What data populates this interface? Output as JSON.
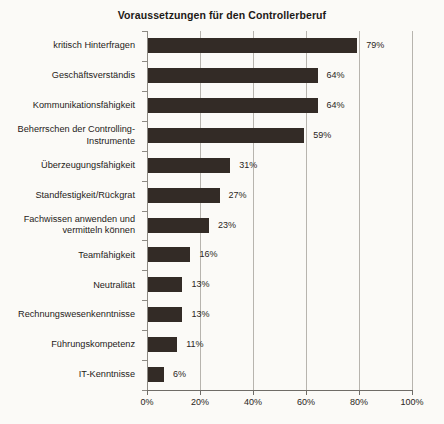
{
  "chart_data": {
    "type": "bar",
    "orientation": "horizontal",
    "title": "Voraussetzungen für den Controllerberuf",
    "xlabel": "",
    "ylabel": "",
    "xlim": [
      0,
      100
    ],
    "grid": true,
    "legend": "none",
    "bar_color": "#332b26",
    "categories": [
      "kritisch Hinterfragen",
      "Geschäftsverständis",
      "Kommunikationsfähigkeit",
      "Beherrschen der Controlling-Instrumente",
      "Überzeugungsfähigkeit",
      "Standfestigkeit/Rückgrat",
      "Fachwissen anwenden und vermitteln können",
      "Teamfähigkeit",
      "Neutralität",
      "Rechnungswesenkenntnisse",
      "Führungskompetenz",
      "IT-Kenntnisse"
    ],
    "category_lines": [
      [
        "kritisch Hinterfragen"
      ],
      [
        "Geschäftsverständis"
      ],
      [
        "Kommunikationsfähigkeit"
      ],
      [
        "Beherrschen der Controlling-",
        "Instrumente"
      ],
      [
        "Überzeugungsfähigkeit"
      ],
      [
        "Standfestigkeit/Rückgrat"
      ],
      [
        "Fachwissen anwenden und",
        "vermitteln können"
      ],
      [
        "Teamfähigkeit"
      ],
      [
        "Neutralität"
      ],
      [
        "Rechnungswesenkenntnisse"
      ],
      [
        "Führungskompetenz"
      ],
      [
        "IT-Kenntnisse"
      ]
    ],
    "values": [
      79,
      64,
      64,
      59,
      31,
      27,
      23,
      16,
      13,
      13,
      11,
      6
    ],
    "value_labels": [
      "79%",
      "64%",
      "64%",
      "59%",
      "31%",
      "27%",
      "23%",
      "16%",
      "13%",
      "13%",
      "11%",
      "6%"
    ],
    "xticks": [
      0,
      20,
      40,
      60,
      80,
      100
    ],
    "xtick_labels": [
      "0%",
      "20%",
      "40%",
      "60%",
      "80%",
      "100%"
    ]
  }
}
